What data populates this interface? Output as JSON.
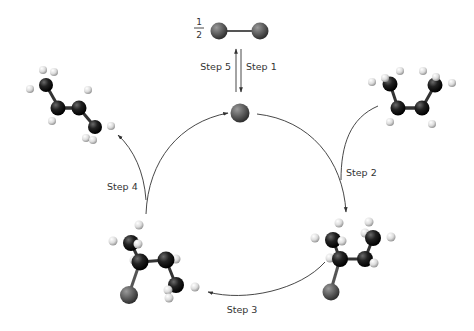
{
  "diagram": {
    "type": "catalytic-cycle",
    "fraction": {
      "numerator": "1",
      "denominator": "2"
    },
    "steps": [
      {
        "id": "step1",
        "label": "Step 1"
      },
      {
        "id": "step2",
        "label": "Step 2"
      },
      {
        "id": "step3",
        "label": "Step 3"
      },
      {
        "id": "step4",
        "label": "Step 4"
      },
      {
        "id": "step5",
        "label": "Step 5"
      }
    ],
    "molecules": [
      {
        "id": "diatomic",
        "description": "diatomic molecule (1/2)"
      },
      {
        "id": "catalyst-atom",
        "description": "single atom at top of cycle"
      },
      {
        "id": "alkene-in",
        "description": "alkene entering (top right)"
      },
      {
        "id": "intermediate-right",
        "description": "alkyl intermediate (bottom right)"
      },
      {
        "id": "intermediate-left",
        "description": "alkyl intermediate (bottom left)"
      },
      {
        "id": "alkene-out",
        "description": "alkene leaving (top left)"
      }
    ],
    "colors": {
      "carbon": "#1a1a1a",
      "hydrogen": "#e6e6e6",
      "halogen": "#6b6b6b",
      "arrow": "#333333"
    }
  }
}
